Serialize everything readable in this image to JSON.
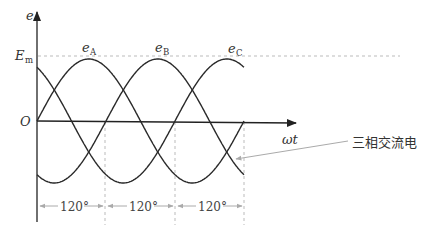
{
  "diagram": {
    "type": "three-phase-ac-waveform",
    "axes": {
      "y_label": "e",
      "x_label": "ωt",
      "origin_label": "O",
      "amplitude_label_main": "E",
      "amplitude_label_sub": "m"
    },
    "curves": [
      {
        "name": "e",
        "sub": "A",
        "phase_deg": 0
      },
      {
        "name": "e",
        "sub": "B",
        "phase_deg": -120
      },
      {
        "name": "e",
        "sub": "C",
        "phase_deg": -240
      }
    ],
    "intervals": [
      "120°",
      "120°",
      "120°"
    ],
    "callout": "三相交流电",
    "colors": {
      "curve": "#2a2a2a",
      "axis": "#2a2a2a",
      "dashed": "#bbbbbb",
      "leader": "#9a9a9a"
    }
  }
}
